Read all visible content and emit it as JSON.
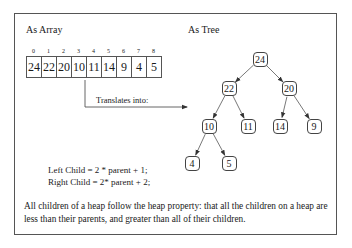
{
  "sections": {
    "array_title": "As Array",
    "tree_title": "As Tree"
  },
  "array": {
    "indices": [
      "0",
      "1",
      "2",
      "3",
      "4",
      "5",
      "6",
      "7",
      "8"
    ],
    "values": [
      "24",
      "22",
      "20",
      "10",
      "11",
      "14",
      "9",
      "4",
      "5"
    ]
  },
  "arrow_label": "Translates into:",
  "tree": {
    "nodes": [
      {
        "id": "n0",
        "value": "24",
        "x": 260,
        "y": 59
      },
      {
        "id": "n1",
        "value": "22",
        "x": 229,
        "y": 88
      },
      {
        "id": "n2",
        "value": "20",
        "x": 289,
        "y": 88
      },
      {
        "id": "n3",
        "value": "10",
        "x": 209,
        "y": 126
      },
      {
        "id": "n4",
        "value": "11",
        "x": 248,
        "y": 126
      },
      {
        "id": "n5",
        "value": "14",
        "x": 280,
        "y": 126
      },
      {
        "id": "n6",
        "value": "9",
        "x": 314,
        "y": 126
      },
      {
        "id": "n7",
        "value": "4",
        "x": 192,
        "y": 163
      },
      {
        "id": "n8",
        "value": "5",
        "x": 229,
        "y": 163
      }
    ],
    "edges": [
      [
        "n0",
        "n1"
      ],
      [
        "n0",
        "n2"
      ],
      [
        "n1",
        "n3"
      ],
      [
        "n1",
        "n4"
      ],
      [
        "n2",
        "n5"
      ],
      [
        "n2",
        "n6"
      ],
      [
        "n3",
        "n7"
      ],
      [
        "n3",
        "n8"
      ]
    ]
  },
  "formulas": {
    "left": "Left Child = 2 * parent  + 1;",
    "right": "Right Child = 2* parent + 2;"
  },
  "description": "All children of a heap follow the heap property: that all the children on a heap are less than their parents, and greater than all of their children.",
  "colors": {
    "line": "#555555",
    "text": "#1a1a1a",
    "background": "#ffffff"
  }
}
